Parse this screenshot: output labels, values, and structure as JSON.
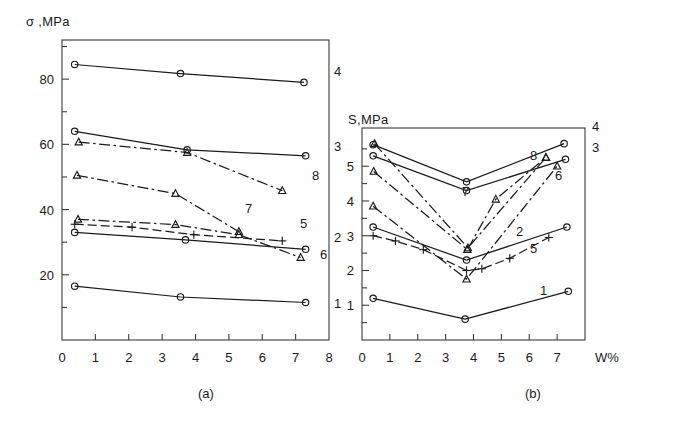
{
  "figure": {
    "panels": [
      {
        "id": "a",
        "caption": "(a)"
      },
      {
        "id": "b",
        "caption": "(b)"
      }
    ]
  },
  "panel_a": {
    "ylabel": "σ ,MPa",
    "xlabel": "",
    "caption": "(a)"
  },
  "panel_b": {
    "ylabel": "S,MPa",
    "xlabel": "W%",
    "caption": "(b)"
  },
  "chart_data": [
    {
      "type": "line",
      "panel": "(a)",
      "title": "",
      "xlabel": "",
      "ylabel": "σ ,MPa",
      "xlim": [
        0,
        8
      ],
      "ylim": [
        0,
        92
      ],
      "xticks": [
        0,
        1,
        2,
        3,
        4,
        5,
        6,
        7,
        8
      ],
      "xticklabels": [
        "0",
        "1",
        "2",
        "3",
        "4",
        "5",
        "6",
        "7",
        "8"
      ],
      "yticks": [
        20,
        40,
        60,
        80
      ],
      "yticklabels": [
        "20",
        "40",
        "60",
        "80"
      ],
      "yminorticks": [
        10,
        30,
        50,
        70,
        90
      ],
      "grid": false,
      "legend": "curve-end-labels",
      "series": [
        {
          "name": "1",
          "label": "1",
          "marker": "circle",
          "linestyle": "solid",
          "x": [
            0.38,
            3.55,
            7.3
          ],
          "y": [
            16.5,
            13.2,
            11.5
          ]
        },
        {
          "name": "2",
          "label": "2",
          "marker": "circle",
          "linestyle": "solid",
          "x": [
            0.38,
            3.7,
            7.3
          ],
          "y": [
            33.0,
            30.7,
            27.8
          ]
        },
        {
          "name": "3",
          "label": "3",
          "marker": "circle",
          "linestyle": "solid",
          "x": [
            0.38,
            3.75,
            7.3
          ],
          "y": [
            64.0,
            58.3,
            56.5
          ]
        },
        {
          "name": "4",
          "label": "4",
          "marker": "circle",
          "linestyle": "solid",
          "x": [
            0.38,
            3.55,
            7.25
          ],
          "y": [
            84.5,
            81.7,
            79.0
          ]
        },
        {
          "name": "5",
          "label": "5",
          "marker": "plus",
          "linestyle": "dashed",
          "x": [
            0.38,
            2.1,
            3.95,
            6.6
          ],
          "y": [
            35.5,
            34.6,
            32.3,
            30.4
          ]
        },
        {
          "name": "6",
          "label": "6",
          "marker": "triangle",
          "linestyle": "dash-dot",
          "x": [
            0.48,
            3.4,
            5.3,
            7.15
          ],
          "y": [
            37.0,
            35.4,
            32.3,
            25.3
          ]
        },
        {
          "name": "7",
          "label": "7",
          "marker": "triangle",
          "linestyle": "dash-dot",
          "x": [
            0.45,
            3.4,
            5.3
          ],
          "y": [
            50.5,
            44.9,
            33.2
          ]
        },
        {
          "name": "8",
          "label": "8",
          "marker": "triangle",
          "linestyle": "dash-dot",
          "x": [
            0.5,
            3.75,
            6.6
          ],
          "y": [
            60.7,
            57.5,
            45.8
          ]
        }
      ]
    },
    {
      "type": "line",
      "panel": "(b)",
      "title": "",
      "xlabel": "W%",
      "ylabel": "S,MPa",
      "xlim": [
        0,
        8
      ],
      "ylim": [
        0,
        6.1
      ],
      "xticks": [
        0,
        1,
        2,
        3,
        4,
        5,
        6,
        7
      ],
      "xticklabels": [
        "0",
        "1",
        "2",
        "3",
        "4",
        "5",
        "6",
        "7"
      ],
      "yticks": [
        1,
        2,
        3,
        4,
        5
      ],
      "yticklabels": [
        "1",
        "2",
        "3",
        "4",
        "5"
      ],
      "yminorticks": [
        0.5,
        1.5,
        2.5,
        3.5,
        4.5,
        5.5
      ],
      "grid": false,
      "legend": "curve-end-labels",
      "series": [
        {
          "name": "1",
          "label": "1",
          "marker": "circle",
          "linestyle": "solid",
          "x": [
            0.4,
            3.7,
            7.4
          ],
          "y": [
            1.2,
            0.6,
            1.4
          ]
        },
        {
          "name": "2",
          "label": "2",
          "marker": "circle",
          "linestyle": "solid",
          "x": [
            0.4,
            3.75,
            7.35
          ],
          "y": [
            3.25,
            2.3,
            3.25
          ]
        },
        {
          "name": "3",
          "label": "3",
          "marker": "circle",
          "linestyle": "solid",
          "x": [
            0.4,
            3.75,
            7.3
          ],
          "y": [
            5.3,
            4.3,
            5.2
          ]
        },
        {
          "name": "4",
          "label": "4",
          "marker": "circle",
          "linestyle": "solid",
          "x": [
            0.4,
            3.75,
            7.25
          ],
          "y": [
            5.62,
            4.55,
            5.65
          ]
        },
        {
          "name": "5",
          "label": "5",
          "marker": "plus",
          "linestyle": "dashed",
          "x": [
            0.4,
            1.2,
            2.2,
            3.75,
            4.3,
            5.3,
            6.7
          ],
          "y": [
            3.0,
            2.85,
            2.6,
            2.0,
            2.05,
            2.35,
            2.95
          ]
        },
        {
          "name": "6",
          "label": "6",
          "marker": "triangle",
          "linestyle": "dash-dot",
          "x": [
            0.4,
            3.75,
            7.0
          ],
          "y": [
            3.85,
            1.75,
            5.0
          ]
        },
        {
          "name": "7",
          "label": "7",
          "marker": "triangle",
          "linestyle": "dash-dot",
          "x": [
            0.42,
            3.78,
            4.8,
            6.6
          ],
          "y": [
            4.85,
            2.6,
            4.05,
            5.25
          ]
        },
        {
          "name": "8",
          "label": "8",
          "marker": "triangle",
          "linestyle": "dash-dot",
          "x": [
            0.45,
            3.8,
            6.6
          ],
          "y": [
            5.65,
            2.65,
            5.25
          ]
        }
      ]
    }
  ]
}
